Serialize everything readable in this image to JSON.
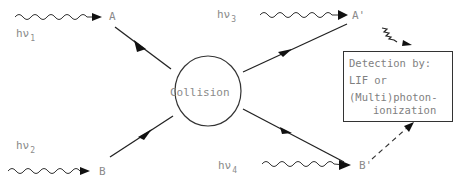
{
  "diagram": {
    "type": "scattering-process",
    "center_node": {
      "label": "Collision",
      "shape": "circle"
    },
    "incoming": [
      {
        "particle": "A",
        "photon": "hν",
        "photon_sub": "1"
      },
      {
        "particle": "B",
        "photon": "hν",
        "photon_sub": "2"
      }
    ],
    "outgoing": [
      {
        "particle": "A'",
        "photon": "hν",
        "photon_sub": "3"
      },
      {
        "particle": "B'",
        "photon": "hν",
        "photon_sub": "4"
      }
    ],
    "detection_box": {
      "line1": "Detection by:",
      "line2": "LIF or",
      "line3": "(Multi)photon-",
      "line4": "ionization"
    },
    "colors": {
      "line": "#222222",
      "text": "#8a8a8a"
    }
  }
}
